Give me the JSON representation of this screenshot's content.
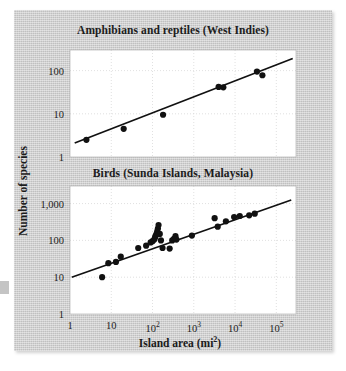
{
  "figure": {
    "background_color": "#c8c8c8",
    "page_color": "#ffffff",
    "plot_background": "#ffffff",
    "ink_color": "#111111",
    "grid_color": "#d8d8d8",
    "y_axis_label": "Number of species",
    "x_axis_label_text": "Island area (mi",
    "x_axis_label_sup": "2",
    "x_axis_label_close": ")"
  },
  "chart_data": [
    {
      "type": "scatter",
      "title": "Amphibians and reptiles (West Indies)",
      "xlabel": "Island area (mi2)",
      "ylabel": "Number of species",
      "xscale": "log",
      "yscale": "log",
      "xlim": [
        1,
        300000
      ],
      "ylim": [
        1,
        300
      ],
      "grid": true,
      "xticks": [
        1,
        10,
        100,
        1000,
        10000,
        100000
      ],
      "xticklabels": [
        "1",
        "10",
        "10^2",
        "10^3",
        "10^4",
        "10^5"
      ],
      "yticks": [
        1,
        10,
        100
      ],
      "yticklabels": [
        "1",
        "10",
        "100"
      ],
      "points": [
        {
          "x": 2.5,
          "y": 2.5
        },
        {
          "x": 20,
          "y": 4.5
        },
        {
          "x": 180,
          "y": 9.5
        },
        {
          "x": 4000,
          "y": 42
        },
        {
          "x": 5200,
          "y": 41
        },
        {
          "x": 34000,
          "y": 95
        },
        {
          "x": 46000,
          "y": 78
        }
      ],
      "fit_line": {
        "x": [
          1.3,
          250000
        ],
        "y": [
          2.1,
          190
        ],
        "style": "solid"
      },
      "legend": null
    },
    {
      "type": "scatter",
      "title": "Birds (Sunda Islands, Malaysia)",
      "xlabel": "Island area (mi2)",
      "ylabel": "Number of species",
      "xscale": "log",
      "yscale": "log",
      "xlim": [
        1,
        300000
      ],
      "ylim": [
        1,
        3000
      ],
      "grid": true,
      "xticks": [
        1,
        10,
        100,
        1000,
        10000,
        100000
      ],
      "xticklabels": [
        "1",
        "10",
        "10^2",
        "10^3",
        "10^4",
        "10^5"
      ],
      "yticks": [
        1,
        10,
        100,
        1000
      ],
      "yticklabels": [
        "1",
        "10",
        "100",
        "1,000"
      ],
      "points": [
        {
          "x": 6,
          "y": 10
        },
        {
          "x": 8.5,
          "y": 24
        },
        {
          "x": 13,
          "y": 26
        },
        {
          "x": 17,
          "y": 36
        },
        {
          "x": 45,
          "y": 62
        },
        {
          "x": 70,
          "y": 72
        },
        {
          "x": 90,
          "y": 88
        },
        {
          "x": 100,
          "y": 95
        },
        {
          "x": 110,
          "y": 105
        },
        {
          "x": 115,
          "y": 120
        },
        {
          "x": 120,
          "y": 135
        },
        {
          "x": 125,
          "y": 150
        },
        {
          "x": 130,
          "y": 175
        },
        {
          "x": 135,
          "y": 210
        },
        {
          "x": 140,
          "y": 260
        },
        {
          "x": 150,
          "y": 150
        },
        {
          "x": 160,
          "y": 100
        },
        {
          "x": 175,
          "y": 62
        },
        {
          "x": 260,
          "y": 60
        },
        {
          "x": 300,
          "y": 100
        },
        {
          "x": 330,
          "y": 110
        },
        {
          "x": 360,
          "y": 130
        },
        {
          "x": 380,
          "y": 105
        },
        {
          "x": 900,
          "y": 135
        },
        {
          "x": 3200,
          "y": 400
        },
        {
          "x": 3800,
          "y": 235
        },
        {
          "x": 6000,
          "y": 330
        },
        {
          "x": 9500,
          "y": 430
        },
        {
          "x": 13000,
          "y": 460
        },
        {
          "x": 22000,
          "y": 480
        },
        {
          "x": 30000,
          "y": 530
        }
      ],
      "fit_line": {
        "x": [
          1.1,
          230000
        ],
        "y": [
          10,
          1250
        ],
        "style": "solid"
      },
      "legend": null
    }
  ]
}
